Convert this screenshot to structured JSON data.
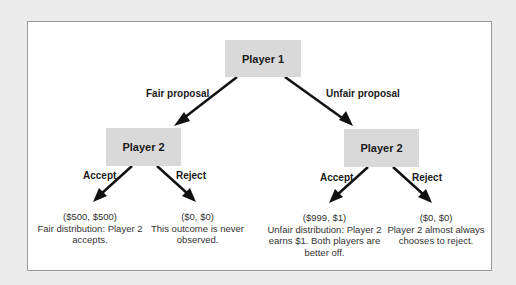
{
  "diagram": {
    "root": {
      "label": "Player 1"
    },
    "branches": [
      {
        "edge_label": "Fair proposal",
        "node": {
          "label": "Player 2"
        },
        "choices": [
          {
            "edge_label": "Accept",
            "payoff": "($500, $500)",
            "description": "Fair distribution: Player 2 accepts."
          },
          {
            "edge_label": "Reject",
            "payoff": "($0, $0)",
            "description": "This outcome is never observed."
          }
        ]
      },
      {
        "edge_label": "Unfair proposal",
        "node": {
          "label": "Player 2"
        },
        "choices": [
          {
            "edge_label": "Accept",
            "payoff": "($999, $1)",
            "description": "Unfair distribution: Player 2 earns $1. Both players are better off."
          },
          {
            "edge_label": "Reject",
            "payoff": "($0, $0)",
            "description": "Player 2 almost always chooses to reject."
          }
        ]
      }
    ],
    "colors": {
      "node_fill": "#d9d9d9",
      "arrow": "#111111",
      "background": "#ececec",
      "frame": "#ffffff"
    }
  }
}
